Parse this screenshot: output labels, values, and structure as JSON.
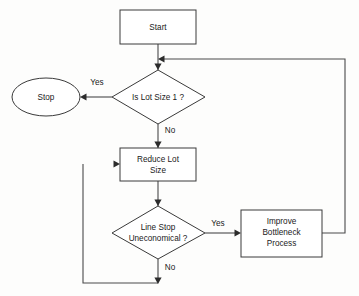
{
  "diagram": {
    "background_color": "#fdfdfc",
    "stroke_color": "#3a3a3a",
    "text_color": "#1a1a1a",
    "nodes": [
      {
        "id": "start",
        "shape": "rectangle",
        "label": "Start",
        "lines": [
          "Start"
        ]
      },
      {
        "id": "decide1",
        "shape": "diamond",
        "label": "Is Lot Size 1 ?",
        "lines": [
          "Is Lot Size 1 ?"
        ]
      },
      {
        "id": "stop",
        "shape": "ellipse",
        "label": "Stop",
        "lines": [
          "Stop"
        ]
      },
      {
        "id": "reduce",
        "shape": "rectangle",
        "label": "Reduce Lot Size",
        "lines": [
          "Reduce Lot",
          "Size"
        ]
      },
      {
        "id": "decide2",
        "shape": "diamond",
        "label": "Line Stop Uneconomical ?",
        "lines": [
          "Line Stop",
          "Uneconomical ?"
        ]
      },
      {
        "id": "improve",
        "shape": "rectangle",
        "label": "Improve Bottleneck Process",
        "lines": [
          "Improve",
          "Bottleneck",
          "Process"
        ]
      }
    ],
    "edges": [
      {
        "from": "start",
        "to": "decide1",
        "label": ""
      },
      {
        "from": "decide1",
        "to": "stop",
        "label": "Yes"
      },
      {
        "from": "decide1",
        "to": "reduce",
        "label": "No"
      },
      {
        "from": "reduce",
        "to": "decide2",
        "label": ""
      },
      {
        "from": "decide2",
        "to": "improve",
        "label": "Yes"
      },
      {
        "from": "decide2",
        "to": "reduce",
        "label": "No"
      },
      {
        "from": "improve",
        "to": "decide1",
        "label": ""
      }
    ],
    "labels": {
      "yes_top": "Yes",
      "no_top": "No",
      "yes_bottom": "Yes",
      "no_bottom": "No"
    }
  }
}
